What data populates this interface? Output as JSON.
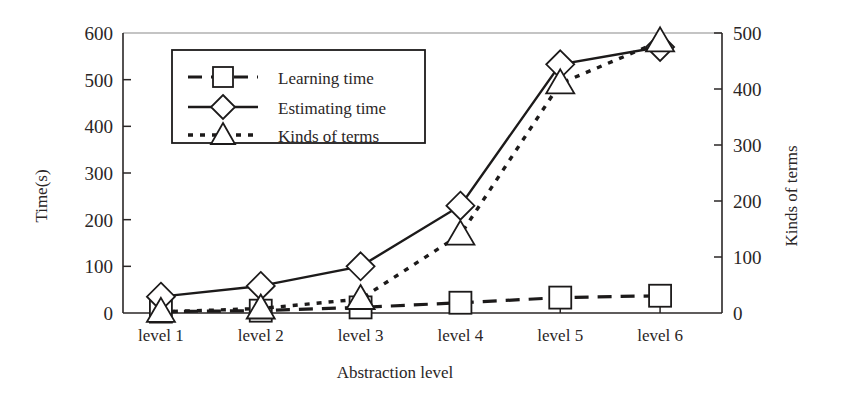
{
  "chart_data": {
    "type": "line",
    "title": "",
    "xlabel": "Abstraction level",
    "ylabel": "Time(s)",
    "y2label": "Kinds of terms",
    "categories": [
      "level 1",
      "level 2",
      "level 3",
      "level 4",
      "level 5",
      "level 6"
    ],
    "ylim": [
      0,
      600
    ],
    "y2lim": [
      0,
      500
    ],
    "yticks": [
      "0",
      "100",
      "200",
      "300",
      "400",
      "500",
      "600"
    ],
    "ytick_values": [
      0,
      100,
      200,
      300,
      400,
      500,
      600
    ],
    "y2ticks": [
      "0",
      "100",
      "200",
      "300",
      "400",
      "500"
    ],
    "y2tick_values": [
      0,
      100,
      200,
      300,
      400,
      500
    ],
    "grid": false,
    "legend_position": "upper-left-inside",
    "series": [
      {
        "name": "Learning time",
        "axis": "left",
        "marker": "square",
        "linestyle": "dashed",
        "values": [
          3,
          5,
          12,
          22,
          33,
          37
        ]
      },
      {
        "name": "Estimating time",
        "axis": "left",
        "marker": "diamond",
        "linestyle": "solid",
        "values": [
          35,
          58,
          100,
          230,
          533,
          570
        ]
      },
      {
        "name": "Kinds of terms",
        "axis": "right",
        "marker": "triangle",
        "linestyle": "dotted",
        "values": [
          2,
          8,
          25,
          140,
          410,
          485
        ]
      }
    ]
  },
  "legend": {
    "items": [
      {
        "label": "Learning time"
      },
      {
        "label": "Estimating time"
      },
      {
        "label": "Kinds of terms"
      }
    ]
  },
  "axes": {
    "left_title": "Time(s)",
    "right_title": "Kinds of terms",
    "bottom_title": "Abstraction level"
  }
}
